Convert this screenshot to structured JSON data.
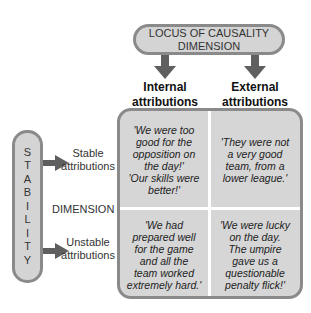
{
  "top_box": {
    "line1": "LOCUS OF CAUSALITY",
    "line2": "DIMENSION"
  },
  "columns": [
    {
      "line1": "Internal",
      "line2": "attributions"
    },
    {
      "line1": "External",
      "line2": "attributions"
    }
  ],
  "stability_box": {
    "letters": [
      "S",
      "T",
      "A",
      "B",
      "I",
      "L",
      "I",
      "T",
      "Y"
    ]
  },
  "rows": [
    {
      "line1": "Stable",
      "line2": "attributions"
    },
    {
      "line1": "Unstable",
      "line2": "attributions"
    }
  ],
  "dimension_label": "DIMENSION",
  "cells": {
    "stable_internal": [
      "'We were too",
      "good for the",
      "opposition on",
      "the day!'",
      "'Our skills were",
      "better!'"
    ],
    "stable_external": [
      "'They were not",
      "a very good",
      "team, from a",
      "lower league.'"
    ],
    "unstable_internal": [
      "'We had",
      "prepared well",
      "for the game",
      "and all the",
      "team worked",
      "extremely hard.'"
    ],
    "unstable_external": [
      "'We were lucky",
      "on the day.",
      "The umpire",
      "gave us a",
      "questionable",
      "penalty flick!'"
    ]
  },
  "colors": {
    "box_fill": "#d4d4d4",
    "box_border": "#8a8a8a",
    "arrow": "#5f5f5f",
    "divider": "#ffffff"
  }
}
